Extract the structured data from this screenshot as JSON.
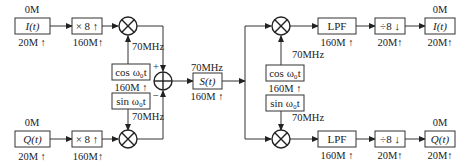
{
  "diagram": {
    "type": "IQ modulator / demodulator block diagram",
    "modulator": {
      "i_input": {
        "label": "I(t)",
        "top_label": "0M",
        "bottom_label": "20M ↑"
      },
      "q_input": {
        "label": "Q(t)",
        "top_label": "0M",
        "bottom_label": "20M ↑"
      },
      "i_interp": {
        "label": "× 8 ↑",
        "bottom_label": "160M↑"
      },
      "q_interp": {
        "label": "× 8 ↑",
        "bottom_label": "160M↑"
      },
      "cos_osc": {
        "label": "cos ω₀t",
        "bottom_label": "160M ↑"
      },
      "sin_osc": {
        "label": "sin ω₀t"
      },
      "i_mixer_freq": "70MHz",
      "q_mixer_freq": "70MHz",
      "adder_plus": "+",
      "adder_minus": "−",
      "output": {
        "label": "S(t)",
        "top_label": "70MHz",
        "bottom_label": "160M ↑"
      }
    },
    "demodulator": {
      "cos_osc": {
        "label": "cos ω₀t",
        "bottom_label": "160M ↑"
      },
      "sin_osc": {
        "label": "sin ω₀t"
      },
      "i_mixer_freq": "70MHz",
      "q_mixer_freq": "70MHz",
      "i_lpf": {
        "label": "LPF",
        "bottom_label": "160M ↑"
      },
      "q_lpf": {
        "label": "LPF",
        "bottom_label": "160M ↑"
      },
      "i_decim": {
        "label": "÷8 ↓",
        "bottom_label": "20M↑"
      },
      "q_decim": {
        "label": "÷8 ↓",
        "bottom_label": "20M↑"
      },
      "i_output": {
        "label": "I(t)",
        "top_label": "0M",
        "bottom_label": "20M↑"
      },
      "q_output": {
        "label": "Q(t)",
        "top_label": "0M",
        "bottom_label": "20M↑"
      }
    }
  }
}
